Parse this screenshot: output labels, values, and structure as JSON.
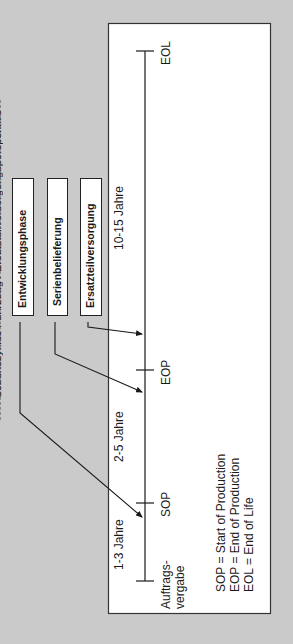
{
  "orientation": "rotated-90-ccw",
  "colors": {
    "background": "#cacaca",
    "frame_fill": "#ffffff",
    "frame_stroke": "#333333",
    "line": "#1a1a1a"
  },
  "cutoff_title": "Lebenszyklus Fahrzeug / Ersatzteilversorgungsperspektive",
  "phases": [
    {
      "label": "Entwicklungsphase"
    },
    {
      "label": "Serienbelieferung"
    },
    {
      "label": "Ersatzteilversorgung"
    }
  ],
  "timeline": {
    "milestones": [
      {
        "label_line1": "Auftrags-",
        "label_line2": "vergabe"
      },
      {
        "label": "SOP"
      },
      {
        "label": "EOP"
      },
      {
        "label": "EOL"
      }
    ],
    "durations": [
      {
        "label": "1-3 Jahre"
      },
      {
        "label": "2-5 Jahre"
      },
      {
        "label": "10-15 Jahre"
      }
    ]
  },
  "legend": [
    {
      "text": "SOP = Start of Production"
    },
    {
      "text": "EOP = End of Production"
    },
    {
      "text": "EOL = End of Life"
    }
  ]
}
